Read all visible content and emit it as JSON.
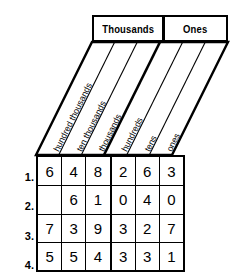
{
  "groups": [
    {
      "label": "Thousands"
    },
    {
      "label": "Ones"
    }
  ],
  "place_labels": [
    {
      "name": "hundred thousands"
    },
    {
      "name": "ten thousands"
    },
    {
      "name": "thousands"
    },
    {
      "name": "hundreds"
    },
    {
      "name": "tens"
    },
    {
      "name": "ones"
    }
  ],
  "rows": [
    {
      "number": "1.",
      "digits": [
        "6",
        "4",
        "8",
        "2",
        "6",
        "3"
      ]
    },
    {
      "number": "2.",
      "digits": [
        "",
        "6",
        "1",
        "0",
        "4",
        "0"
      ]
    },
    {
      "number": "3.",
      "digits": [
        "7",
        "3",
        "9",
        "3",
        "2",
        "7"
      ]
    },
    {
      "number": "4.",
      "digits": [
        "5",
        "5",
        "4",
        "3",
        "3",
        "1"
      ]
    }
  ],
  "colors": {
    "ink": "#000000",
    "paper": "#ffffff"
  }
}
